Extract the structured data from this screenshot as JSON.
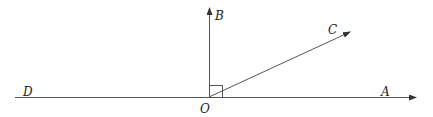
{
  "diagram": {
    "type": "geometry-angles",
    "vertex": "O",
    "labels": {
      "A": "A",
      "B": "B",
      "C": "C",
      "D": "D",
      "O": "O"
    },
    "rays": [
      {
        "from": "O",
        "to": "A",
        "arrow": true
      },
      {
        "from": "O",
        "to": "B",
        "arrow": true
      },
      {
        "from": "O",
        "to": "C",
        "arrow": true
      },
      {
        "from": "O",
        "to": "D",
        "arrow": false
      }
    ],
    "right_angle": {
      "between": [
        "OA",
        "OB"
      ]
    }
  }
}
